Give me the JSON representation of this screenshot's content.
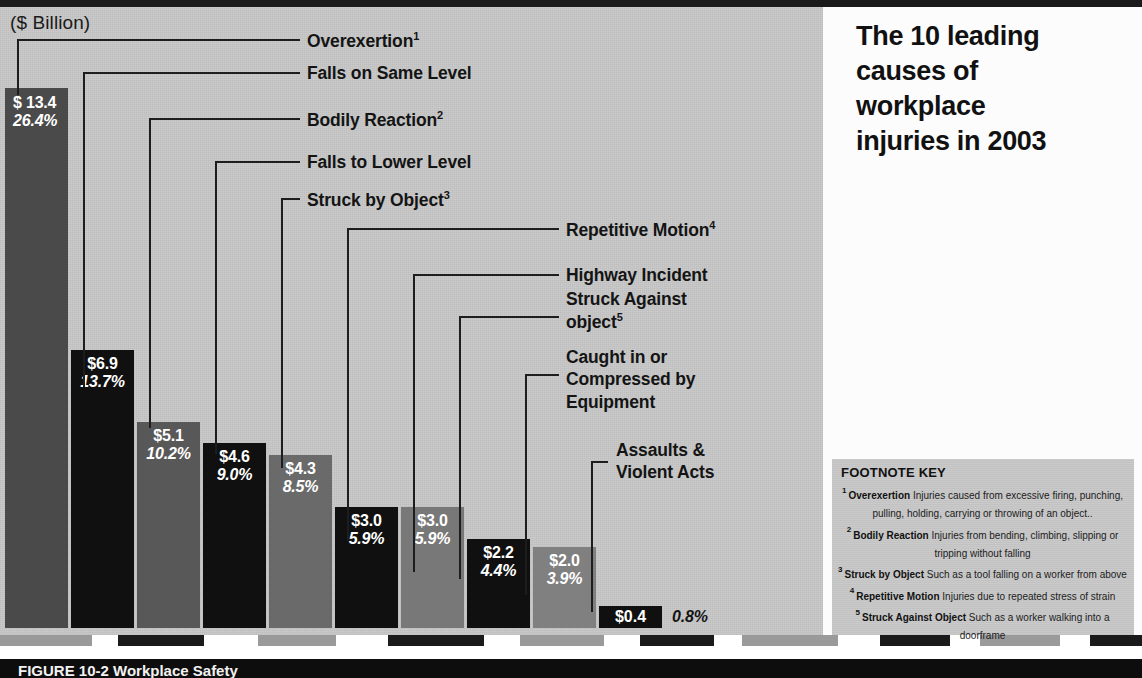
{
  "axis_caption": "($ Billion)",
  "title": "The 10 leading\ncauses of\nworkplace\ninjuries in 2003",
  "caption": "FIGURE 10-2      Workplace Safety",
  "footnote_key": {
    "heading": "FOOTNOTE KEY",
    "items": [
      {
        "num": "1",
        "term": "Overexertion",
        "desc": "Injuries caused from excessive firing, punching, pulling, holding, carrying or throwing of an object.."
      },
      {
        "num": "2",
        "term": "Bodily Reaction",
        "desc": "Injuries from bending, climbing, slipping or tripping without falling"
      },
      {
        "num": "3",
        "term": "Struck by Object",
        "desc": "Such as a tool falling on a worker from above"
      },
      {
        "num": "4",
        "term": "Repetitive Motion",
        "desc": "Injuries due to repeated stress of strain"
      },
      {
        "num": "5",
        "term": "Struck Against Object",
        "desc": "Such as a worker walking into a doorframe"
      }
    ]
  },
  "chart_data": {
    "type": "bar",
    "title": "The 10 leading causes of workplace injuries in 2003",
    "ylabel": "($ Billion)",
    "xlabel": "",
    "ylim": [
      0,
      13.4
    ],
    "grid": false,
    "legend": "none",
    "categories": [
      "Overexertion",
      "Falls on Same Level",
      "Bodily Reaction",
      "Falls to Lower Level",
      "Struck by Object",
      "Repetitive Motion",
      "Highway Incident",
      "Struck Against object",
      "Caught in or Compressed by Equipment",
      "Assaults & Violent Acts"
    ],
    "values": [
      13.4,
      6.9,
      5.1,
      4.6,
      4.3,
      3.0,
      3.0,
      2.2,
      2.0,
      0.4
    ],
    "percent": [
      26.4,
      13.7,
      10.2,
      9.0,
      8.5,
      5.9,
      5.9,
      4.4,
      3.9,
      0.8
    ],
    "value_labels": [
      "$ 13.4",
      "$6.9",
      "$5.1",
      "$4.6",
      "$4.3",
      "$3.0",
      "$3.0",
      "$2.2",
      "$2.0",
      "$0.4"
    ],
    "percent_labels": [
      "26.4%",
      "13.7%",
      "10.2%",
      "9.0%",
      "8.5%",
      "5.9%",
      "5.9%",
      "4.4%",
      "3.9%",
      "0.8%"
    ],
    "label_superscripts": [
      "1",
      "",
      "2",
      "",
      "3",
      "4",
      "",
      "5",
      "",
      ""
    ],
    "bar_colors": [
      "#4a4a4a",
      "#101010",
      "#585858",
      "#101010",
      "#6a6a6a",
      "#101010",
      "#787878",
      "#101010",
      "#808080",
      "#101010"
    ]
  },
  "labels": [
    {
      "text": "Overexertion",
      "sup": "1"
    },
    {
      "text": "Falls on Same Level",
      "sup": ""
    },
    {
      "text": "Bodily Reaction",
      "sup": "2"
    },
    {
      "text": "Falls to Lower Level",
      "sup": ""
    },
    {
      "text": "Struck by Object",
      "sup": "3"
    },
    {
      "text": "Repetitive Motion",
      "sup": "4"
    },
    {
      "text": "Highway Incident",
      "sup": ""
    },
    {
      "text": "Struck Against\nobject",
      "sup": "5"
    },
    {
      "text": "Caught in or\nCompressed by\nEquipment",
      "sup": ""
    },
    {
      "text": "Assaults &\nViolent Acts",
      "sup": ""
    }
  ]
}
